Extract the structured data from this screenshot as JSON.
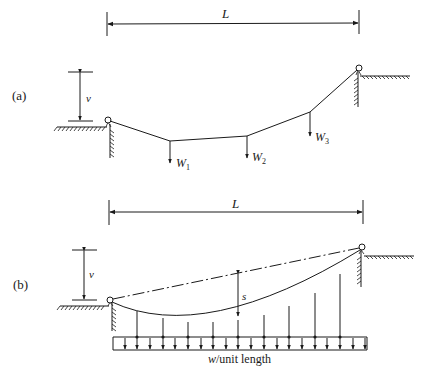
{
  "figure": {
    "panel_a": {
      "label": "(a)",
      "span_label": "L",
      "sag_label": "v",
      "loads": [
        {
          "name": "W",
          "sub": "1"
        },
        {
          "name": "W",
          "sub": "2"
        },
        {
          "name": "W",
          "sub": "3"
        }
      ]
    },
    "panel_b": {
      "label": "(b)",
      "span_label": "L",
      "sag_label": "v",
      "deflection_label": "s",
      "load_label_var": "w",
      "load_label_rest": "/unit length"
    }
  },
  "colors": {
    "line": "#1a1a1a",
    "background": "#ffffff"
  }
}
